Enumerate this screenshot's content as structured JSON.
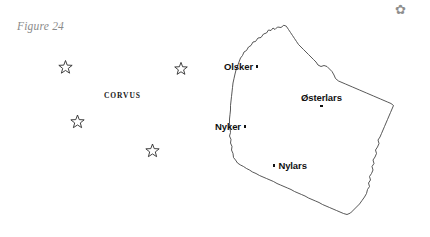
{
  "figure": {
    "caption": "Figure 24",
    "corner_glyph": "✿",
    "corner_glyph_name": "small-ornament-glyph",
    "background_color": "#ffffff",
    "ink_color": "#111111",
    "caption_color": "#8a8a8a",
    "coast_color": "#3a3a3a",
    "star_color": "#2b2b2b"
  },
  "constellation": {
    "name": "CORVUS",
    "name_position": {
      "x": 104,
      "y": 91
    },
    "stars": [
      {
        "id": "star-1",
        "x": 65.5,
        "y": 67.5,
        "r": 7.0
      },
      {
        "id": "star-2",
        "x": 181.0,
        "y": 69.0,
        "r": 6.6
      },
      {
        "id": "star-3",
        "x": 77.5,
        "y": 122.0,
        "r": 7.0
      },
      {
        "id": "star-4",
        "x": 152.5,
        "y": 151.0,
        "r": 7.0
      }
    ]
  },
  "map": {
    "coast_outline": "M 283.5 25.5 L 281.0 27.5 L 277.5 27.0 L 275.0 29.5 L 273.0 28.0 L 271.0 30.5 L 268.5 30.0 L 266.5 33.0 L 263.5 34.0 L 261.0 37.5 L 258.0 38.0 L 255.5 41.5 L 253.0 42.0 L 251.0 45.5 L 248.5 47.0 L 246.5 50.5 L 244.0 52.0 L 242.5 55.5 L 240.5 58.0 L 239.0 62.0 L 237.5 66.0 L 236.0 70.0 L 235.0 74.0 L 234.0 78.5 L 233.0 83.0 L 232.5 87.5 L 232.0 92.0 L 231.5 96.5 L 231.0 101.0 L 230.5 105.5 L 230.5 110.0 L 230.0 114.5 L 229.5 119.0 L 229.5 123.5 L 230.0 128.0 L 230.5 132.5 L 229.5 136.0 L 231.0 139.5 L 230.5 143.0 L 232.0 146.5 L 231.5 150.0 L 233.0 153.5 L 233.5 157.5 L 235.5 160.0 L 237.5 163.0 L 240.5 165.0 L 243.5 166.5 L 246.5 168.5 L 249.5 170.0 L 252.5 172.0 L 256.0 173.5 L 259.5 175.5 L 263.0 177.0 L 266.5 178.5 L 270.0 180.0 L 273.5 181.5 L 277.0 183.5 L 280.5 185.0 L 284.0 186.5 L 287.5 188.0 L 291.0 189.5 L 294.5 191.5 L 298.0 193.0 L 301.5 194.5 L 305.0 196.0 L 308.5 198.0 L 312.0 199.5 L 315.5 201.0 L 319.0 202.5 L 322.5 204.5 L 326.0 206.0 L 329.5 207.5 L 333.0 209.0 L 336.5 210.5 L 340.0 212.0 L 343.5 213.5 L 347.0 214.5 L 350.5 213.0 L 353.5 210.0 L 356.5 207.0 L 359.5 204.0 L 362.0 200.5 L 364.5 197.0 L 366.5 193.5 L 367.5 189.5 L 369.5 186.5 L 368.5 183.0 L 370.5 180.0 L 369.5 176.5 L 371.5 173.5 L 373.0 170.0 L 372.0 166.5 L 374.0 163.5 L 373.0 160.0 L 375.0 157.0 L 376.5 153.5 L 375.5 150.0 L 377.5 147.0 L 379.0 143.5 L 378.0 140.0 L 380.0 137.0 L 381.5 133.5 L 383.0 130.0 L 384.5 126.5 L 386.0 123.0 L 387.5 119.5 L 389.0 116.0 L 390.5 112.5 L 392.0 109.0 L 393.5 105.5 L 391.0 103.5 L 387.5 102.0 L 384.0 100.5 L 380.5 99.0 L 377.0 97.5 L 373.5 96.0 L 370.0 94.5 L 366.5 93.0 L 363.0 91.5 L 359.5 90.0 L 356.0 88.5 L 352.5 87.0 L 349.0 85.5 L 345.5 84.0 L 342.0 82.5 L 338.5 81.0 L 335.5 78.5 L 334.0 75.0 L 332.0 71.5 L 329.5 69.0 L 327.0 66.5 L 324.0 65.5 L 321.0 66.5 L 318.0 65.0 L 316.0 62.0 L 313.5 59.5 L 311.0 57.0 L 308.5 54.5 L 306.0 52.0 L 303.5 49.5 L 301.0 47.0 L 298.5 44.5 L 296.5 41.5 L 294.5 38.5 L 292.5 35.5 L 290.5 32.5 L 288.5 29.5 L 286.5 26.5 Z",
    "places": [
      {
        "id": "place-olsker",
        "name": "Olsker",
        "x": 224,
        "y": 61,
        "marker": "right"
      },
      {
        "id": "place-osterlars",
        "name": "Østerlars",
        "x": 301,
        "y": 92,
        "marker": "below"
      },
      {
        "id": "place-nyker",
        "name": "Nyker",
        "x": 215,
        "y": 121,
        "marker": "right"
      },
      {
        "id": "place-nylars",
        "name": "Nylars",
        "x": 273,
        "y": 160,
        "marker": "left"
      }
    ]
  }
}
